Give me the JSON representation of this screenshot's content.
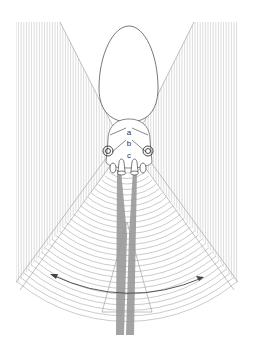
{
  "diagram": {
    "labels": {
      "a": "a",
      "b": "b",
      "c": "c"
    },
    "colors": {
      "stripes": "#bdbdbd",
      "arcs": "#a8a8a8",
      "outline": "#555555",
      "beams": "#9a9a9a",
      "arrow": "#444444",
      "background": "#ffffff"
    },
    "elements": [
      "egg-shaped head outline",
      "left vertical striped field",
      "right vertical striped field",
      "concentric arc wave fan",
      "two vertical grey beams",
      "central cone",
      "double-headed curved arrow"
    ]
  }
}
